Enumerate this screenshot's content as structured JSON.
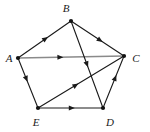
{
  "figure": {
    "type": "directed-graph",
    "title": "",
    "background_color": "#ffffff",
    "width": 150,
    "height": 132
  },
  "style": {
    "edge_color": "#1a1a1a",
    "edge_highlight_color": "#8a8a8a",
    "vertex_color": "#111111",
    "label_color": "#1a1a1a",
    "edge_width": 1.1,
    "edge_highlight_width": 1.6,
    "vertex_radius": 2.1
  },
  "graph_data": {
    "vertices": [
      {
        "id": "A",
        "label": "A",
        "x": 18,
        "y": 58,
        "label_x": 9,
        "label_y": 58
      },
      {
        "id": "B",
        "label": "B",
        "x": 71,
        "y": 21,
        "label_x": 66,
        "label_y": 8
      },
      {
        "id": "C",
        "label": "C",
        "x": 124,
        "y": 56,
        "label_x": 136,
        "label_y": 58
      },
      {
        "id": "D",
        "label": "D",
        "x": 103,
        "y": 108,
        "label_x": 110,
        "label_y": 122
      },
      {
        "id": "E",
        "label": "E",
        "x": 38,
        "y": 108,
        "label_x": 36,
        "label_y": 122
      }
    ],
    "edges": [
      {
        "id": "A-B",
        "from": "A",
        "to": "B",
        "directed": true,
        "arrow_t": 0.52,
        "color": "#1a1a1a",
        "width": 1.1
      },
      {
        "id": "B-C",
        "from": "B",
        "to": "C",
        "directed": true,
        "arrow_t": 0.55,
        "color": "#1a1a1a",
        "width": 1.1
      },
      {
        "id": "A-C",
        "from": "A",
        "to": "C",
        "directed": true,
        "arrow_t": 0.4,
        "color": "#8a8a8a",
        "width": 1.6
      },
      {
        "id": "A-E",
        "from": "A",
        "to": "E",
        "directed": true,
        "arrow_t": 0.42,
        "color": "#1a1a1a",
        "width": 1.1
      },
      {
        "id": "E-D",
        "from": "E",
        "to": "D",
        "directed": true,
        "arrow_t": 0.52,
        "color": "#1a1a1a",
        "width": 1.1
      },
      {
        "id": "E-C",
        "from": "E",
        "to": "C",
        "directed": true,
        "arrow_t": 0.44,
        "color": "#1a1a1a",
        "width": 1.1
      },
      {
        "id": "B-D",
        "from": "B",
        "to": "D",
        "directed": true,
        "arrow_t": 0.5,
        "color": "#1a1a1a",
        "width": 1.1
      },
      {
        "id": "D-C",
        "from": "D",
        "to": "C",
        "directed": true,
        "arrow_t": 0.58,
        "color": "#1a1a1a",
        "width": 1.1
      }
    ]
  }
}
